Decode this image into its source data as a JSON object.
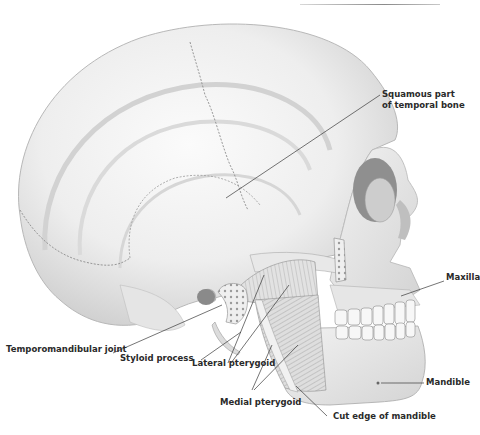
{
  "figure": {
    "header_fragment": "· · ·  · · · · · · ·",
    "colors": {
      "bone_light": "#f4f4f4",
      "bone_shade": "#c9c9c9",
      "bone_dark": "#8e8e8e",
      "muscle": "#cfcfcf",
      "leader_line": "#3a3a3a",
      "label_text": "#2a2a2a"
    }
  },
  "labels": {
    "squamous_line1": "Squamous part",
    "squamous_line2": "of temporal bone",
    "maxilla": "Maxilla",
    "mandible": "Mandible",
    "tmj": "Temporomandibular joint",
    "styloid": "Styloid process",
    "lateral_pterygoid": "Lateral pterygoid",
    "medial_pterygoid": "Medial pterygoid",
    "cut_edge": "Cut edge of mandible"
  }
}
